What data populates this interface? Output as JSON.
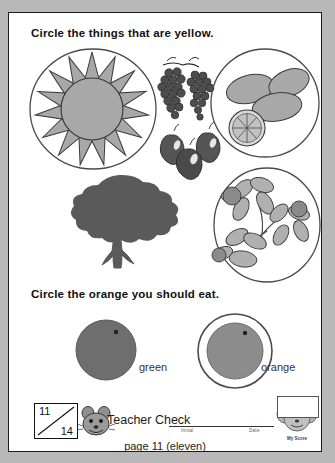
{
  "page": {
    "background_color": "#b8b8b8",
    "paper_color": "#ffffff",
    "border_color": "#1a1a1a"
  },
  "exercises": [
    {
      "id": "yellow-things",
      "prompt": "Circle the things that are yellow.",
      "items": [
        {
          "name": "sun",
          "circled": true,
          "icon": "sun-icon"
        },
        {
          "name": "grapes",
          "circled": false,
          "icon": "grapes-icon"
        },
        {
          "name": "lemons",
          "circled": true,
          "icon": "lemons-icon"
        },
        {
          "name": "apples",
          "circled": false,
          "icon": "apples-icon"
        },
        {
          "name": "tree",
          "circled": false,
          "icon": "tree-icon"
        },
        {
          "name": "daffodils",
          "circled": true,
          "icon": "daffodils-icon"
        }
      ]
    },
    {
      "id": "orange-to-eat",
      "prompt": "Circle the orange you should eat.",
      "choices": [
        {
          "label": "green",
          "circled": false,
          "icon": "round-fruit-icon"
        },
        {
          "label": "orange",
          "circled": true,
          "icon": "round-fruit-icon"
        }
      ]
    }
  ],
  "footer": {
    "score": {
      "earned": "11",
      "total": "14"
    },
    "teacher_check_label": "Teacher Check",
    "initial_label": "Initial",
    "date_label": "Date",
    "page_label": "page 11 (eleven)",
    "stamp_label": "My Score"
  }
}
